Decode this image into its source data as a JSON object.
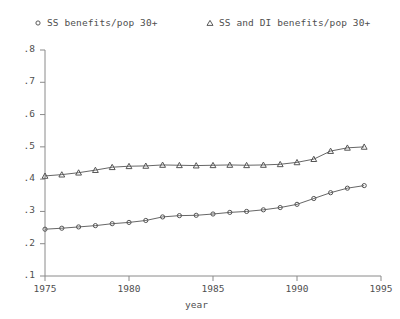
{
  "chart_data": {
    "type": "line",
    "title": "",
    "xlabel": "year",
    "ylabel": "",
    "xlim": [
      1975,
      1995
    ],
    "ylim": [
      0.1,
      0.8
    ],
    "xticks": [
      1975,
      1980,
      1985,
      1990,
      1995
    ],
    "xtick_labels": [
      "1975",
      "1980",
      "1985",
      "1990",
      "1995"
    ],
    "yticks": [
      0.1,
      0.2,
      0.3,
      0.4,
      0.5,
      0.6,
      0.7,
      0.8
    ],
    "ytick_labels": [
      ".1",
      ".2",
      ".3",
      ".4",
      ".5",
      ".6",
      ".7",
      ".8"
    ],
    "grid": false,
    "legend_position": "top",
    "x": [
      1975,
      1976,
      1977,
      1978,
      1979,
      1980,
      1981,
      1982,
      1983,
      1984,
      1985,
      1986,
      1987,
      1988,
      1989,
      1990,
      1991,
      1992,
      1993,
      1994
    ],
    "series": [
      {
        "name": "SS benefits/pop 30+",
        "marker": "circle",
        "values": [
          0.245,
          0.248,
          0.252,
          0.256,
          0.262,
          0.266,
          0.272,
          0.283,
          0.287,
          0.288,
          0.292,
          0.297,
          0.3,
          0.305,
          0.312,
          0.322,
          0.34,
          0.358,
          0.372,
          0.38
        ]
      },
      {
        "name": "SS and DI benefits/pop 30+",
        "marker": "triangle",
        "values": [
          0.41,
          0.414,
          0.42,
          0.428,
          0.437,
          0.44,
          0.441,
          0.444,
          0.443,
          0.442,
          0.443,
          0.444,
          0.443,
          0.444,
          0.446,
          0.452,
          0.462,
          0.487,
          0.497,
          0.5
        ]
      }
    ]
  },
  "legend": {
    "items": [
      {
        "label": "SS benefits/pop 30+",
        "marker": "circle-marker"
      },
      {
        "label": "SS and DI benefits/pop 30+",
        "marker": "triangle-marker"
      }
    ]
  },
  "axes": {
    "x_axis_title": "year"
  },
  "colors": {
    "line": "#555555",
    "axis": "#8a8a8a",
    "text": "#4f4f4f",
    "background": "#ffffff"
  }
}
